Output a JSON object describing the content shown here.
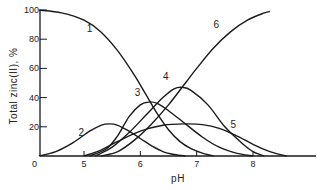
{
  "chart_data": {
    "type": "line",
    "title": "",
    "xlabel": "pH",
    "ylabel": "Total zinc(II), %",
    "xlim": [
      4.2,
      9.1
    ],
    "ylim": [
      0,
      100
    ],
    "x_ticks": [
      5,
      6,
      7,
      8
    ],
    "y_ticks": [
      0,
      20,
      40,
      60,
      80,
      100
    ],
    "grid": false,
    "legend": "inline curve numbers",
    "series": [
      {
        "name": "1",
        "label_pos": [
          5.1,
          85
        ],
        "points": [
          [
            4.2,
            100
          ],
          [
            4.6,
            98
          ],
          [
            5.0,
            93
          ],
          [
            5.3,
            85
          ],
          [
            5.6,
            72
          ],
          [
            5.9,
            55
          ],
          [
            6.1,
            42
          ],
          [
            6.3,
            29
          ],
          [
            6.5,
            18
          ],
          [
            6.7,
            10
          ],
          [
            6.9,
            5
          ],
          [
            7.1,
            2
          ],
          [
            7.3,
            0
          ]
        ]
      },
      {
        "name": "2",
        "label_pos": [
          4.95,
          14
        ],
        "points": [
          [
            4.2,
            0
          ],
          [
            4.5,
            3
          ],
          [
            4.8,
            9
          ],
          [
            5.1,
            17
          ],
          [
            5.3,
            21
          ],
          [
            5.45,
            22
          ],
          [
            5.6,
            21
          ],
          [
            5.8,
            17
          ],
          [
            6.0,
            12
          ],
          [
            6.2,
            7
          ],
          [
            6.4,
            3
          ],
          [
            6.6,
            1
          ],
          [
            6.8,
            0
          ]
        ]
      },
      {
        "name": "3",
        "label_pos": [
          5.95,
          41
        ],
        "points": [
          [
            5.1,
            0
          ],
          [
            5.4,
            5
          ],
          [
            5.6,
            14
          ],
          [
            5.8,
            27
          ],
          [
            6.0,
            35
          ],
          [
            6.15,
            37
          ],
          [
            6.3,
            36
          ],
          [
            6.5,
            31
          ],
          [
            6.8,
            22
          ],
          [
            7.1,
            13
          ],
          [
            7.4,
            6
          ],
          [
            7.7,
            2
          ],
          [
            8.0,
            0
          ]
        ]
      },
      {
        "name": "4",
        "label_pos": [
          6.45,
          52
        ],
        "points": [
          [
            5.2,
            0
          ],
          [
            5.5,
            6
          ],
          [
            5.8,
            16
          ],
          [
            6.1,
            28
          ],
          [
            6.4,
            40
          ],
          [
            6.6,
            46
          ],
          [
            6.75,
            47
          ],
          [
            6.9,
            45
          ],
          [
            7.2,
            35
          ],
          [
            7.5,
            20
          ],
          [
            7.8,
            9
          ],
          [
            8.0,
            3
          ],
          [
            8.2,
            0
          ]
        ]
      },
      {
        "name": "5",
        "label_pos": [
          7.65,
          19
        ],
        "points": [
          [
            5.0,
            0
          ],
          [
            5.3,
            4
          ],
          [
            5.6,
            10
          ],
          [
            6.0,
            17
          ],
          [
            6.4,
            21
          ],
          [
            6.8,
            22
          ],
          [
            7.1,
            21.5
          ],
          [
            7.4,
            19
          ],
          [
            7.7,
            14
          ],
          [
            8.0,
            8
          ],
          [
            8.3,
            3
          ],
          [
            8.6,
            0
          ]
        ]
      },
      {
        "name": "6",
        "label_pos": [
          7.35,
          88
        ],
        "points": [
          [
            5.3,
            0
          ],
          [
            5.6,
            3
          ],
          [
            5.9,
            11
          ],
          [
            6.2,
            22
          ],
          [
            6.5,
            35
          ],
          [
            6.8,
            50
          ],
          [
            7.0,
            60
          ],
          [
            7.3,
            74
          ],
          [
            7.6,
            85
          ],
          [
            7.9,
            93
          ],
          [
            8.2,
            98
          ],
          [
            8.3,
            99
          ]
        ]
      }
    ]
  },
  "axis": {
    "x_title": "pH",
    "y_title": "Total zinc(II),  %",
    "x_tick_labels": [
      "5",
      "6",
      "7",
      "8"
    ],
    "y_tick_labels": [
      "0",
      "20",
      "40",
      "60",
      "80",
      "100"
    ]
  },
  "style": {
    "line_color": "#1a1a1a",
    "text_color": "#222222",
    "background": "#ffffff"
  }
}
